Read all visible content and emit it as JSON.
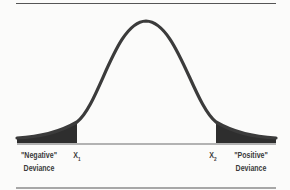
{
  "diagram": {
    "type": "normal-distribution",
    "labels": {
      "negative_line1": "\"Negative\"",
      "negative_line2": "Deviance",
      "positive_line1": "\"Positive\"",
      "positive_line2": "Deviance",
      "x1": "X",
      "x1_sub": "1",
      "x2": "X",
      "x2_sub": "2"
    },
    "colors": {
      "curve": "#3b3b3b",
      "tail_fill": "#2e2e2e",
      "baseline": "#9a9a9a",
      "rule": "#555555",
      "background": "#fbfbfa"
    }
  }
}
